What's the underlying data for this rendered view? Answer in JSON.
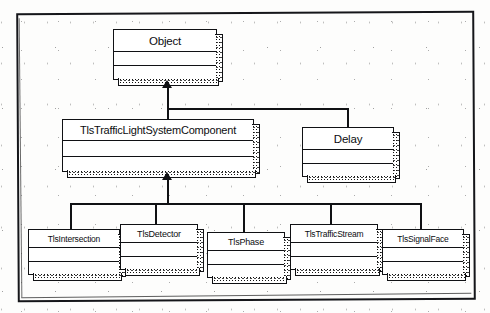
{
  "diagram": {
    "type": "uml-class-diagram",
    "notation": "generalization",
    "frame_label": "",
    "ink_color": "#101114",
    "paper_color": "#fdfdfc"
  },
  "classes": [
    {
      "id": "object",
      "name": "Object",
      "x": 113,
      "y": 29,
      "w": 104,
      "h": 51
    },
    {
      "id": "component",
      "name": "TlsTrafficLightSystemComponent",
      "x": 62,
      "y": 119,
      "w": 192,
      "h": 53
    },
    {
      "id": "delay",
      "name": "Delay",
      "x": 302,
      "y": 127,
      "w": 92,
      "h": 50
    },
    {
      "id": "intersection",
      "name": "TlsIntersection",
      "x": 28,
      "y": 229,
      "w": 92,
      "h": 46
    },
    {
      "id": "detector",
      "name": "TlsDetector",
      "x": 120,
      "y": 224,
      "w": 78,
      "h": 46
    },
    {
      "id": "phase",
      "name": "TlsPhase",
      "x": 207,
      "y": 232,
      "w": 78,
      "h": 46
    },
    {
      "id": "stream",
      "name": "TlsTrafficStream",
      "x": 290,
      "y": 224,
      "w": 88,
      "h": 46
    },
    {
      "id": "signalface",
      "name": "TlsSignalFace",
      "x": 382,
      "y": 229,
      "w": 82,
      "h": 46
    }
  ],
  "relations": [
    {
      "from": "component",
      "to": "object",
      "kind": "generalization"
    },
    {
      "from": "delay",
      "to": "object",
      "kind": "generalization"
    },
    {
      "from": "intersection",
      "to": "component",
      "kind": "generalization"
    },
    {
      "from": "detector",
      "to": "component",
      "kind": "generalization"
    },
    {
      "from": "phase",
      "to": "component",
      "kind": "generalization"
    },
    {
      "from": "stream",
      "to": "component",
      "kind": "generalization"
    },
    {
      "from": "signalface",
      "to": "component",
      "kind": "generalization"
    }
  ]
}
